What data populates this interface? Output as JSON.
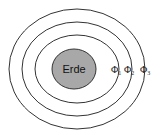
{
  "diagram": {
    "center_label": "Erde",
    "earth_fill": "#a8a8a8",
    "stroke_color": "#333333",
    "shells": [
      {
        "label": "Φ",
        "sub": "1"
      },
      {
        "label": "Φ",
        "sub": "2"
      },
      {
        "label": "Φ",
        "sub": "3"
      }
    ]
  }
}
